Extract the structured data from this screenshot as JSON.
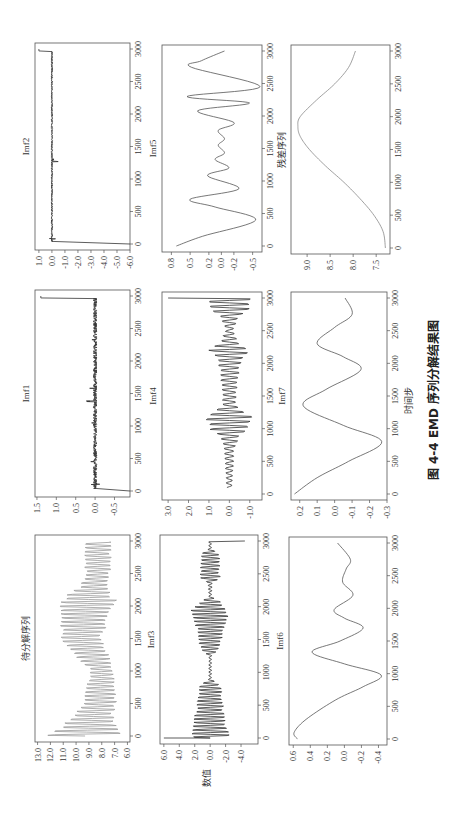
{
  "caption": "图 4-4    EMD 序列分解结果图",
  "xlabel": "时间步",
  "ylabel": "数值",
  "chart_data": [
    {
      "type": "line",
      "title": "待分解序列",
      "box": [
        35,
        535,
        130,
        742
      ],
      "xlim": [
        0,
        3000
      ],
      "xticks": [
        0,
        500,
        1000,
        1500,
        2000,
        2500,
        3000
      ],
      "ylim": [
        5.8,
        13.2
      ],
      "yticks": [
        "13.0",
        "12.0",
        "11.0",
        "10.0",
        "9.0",
        "8.0",
        "7.0",
        "6.0"
      ],
      "ytickvals": [
        13,
        12,
        11,
        10,
        9,
        8,
        7,
        6
      ],
      "color": "#9a9a9a",
      "gen": {
        "kind": "osc",
        "base": [
          [
            0,
            9.3
          ],
          [
            500,
            8.2
          ],
          [
            1000,
            8.0
          ],
          [
            1500,
            9.6
          ],
          [
            2000,
            9.2
          ],
          [
            2500,
            8.3
          ],
          [
            3000,
            8.3
          ]
        ],
        "amp": [
          [
            0,
            3.5
          ],
          [
            300,
            1.8
          ],
          [
            800,
            1.3
          ],
          [
            1000,
            1.0
          ],
          [
            1200,
            1.5
          ],
          [
            1800,
            2.2
          ],
          [
            2100,
            2.6
          ],
          [
            2300,
            1.2
          ],
          [
            3000,
            1.2
          ]
        ],
        "period": 60
      }
    },
    {
      "type": "line",
      "title": "Imf1",
      "box": [
        35,
        290,
        130,
        497
      ],
      "xlim": [
        0,
        3000
      ],
      "xticks": [
        0,
        500,
        1000,
        1500,
        2000,
        2500,
        3000
      ],
      "ylim": [
        -0.9,
        1.55
      ],
      "yticks": [
        "1.5",
        "1.0",
        "0.5",
        "0.0",
        "-0.5"
      ],
      "ytickvals": [
        1.5,
        1.0,
        0.5,
        0.0,
        -0.5
      ],
      "color": "#333333",
      "gen": {
        "kind": "noise",
        "edgeStart": -0.9,
        "edgeEnd": 1.4,
        "amp": 0.05,
        "spikes": [
          [
            100,
            0.12
          ],
          [
            450,
            0.12
          ],
          [
            1050,
            0.2
          ],
          [
            1230,
            0.12
          ],
          [
            1380,
            0.25
          ],
          [
            1580,
            0.22
          ],
          [
            2330,
            0.1
          ]
        ]
      }
    },
    {
      "type": "line",
      "title": "Imf2",
      "box": [
        35,
        43,
        130,
        250
      ],
      "xlim": [
        0,
        3000
      ],
      "xticks": [
        0,
        500,
        1000,
        1500,
        2000,
        2500,
        3000
      ],
      "ylim": [
        -6.0,
        1.3
      ],
      "yticks": [
        "1.0",
        "0.0",
        "-1.0",
        "-2.0",
        "-3.0",
        "-4.0",
        "-5.0",
        "-6.0"
      ],
      "ytickvals": [
        1,
        0,
        -1,
        -2,
        -3,
        -4,
        -5,
        -6
      ],
      "color": "#333333",
      "gen": {
        "kind": "noise",
        "edgeStart": -6.0,
        "edgeEnd": 1.0,
        "amp": 0.06,
        "spikes": [
          [
            80,
            0.3
          ],
          [
            1270,
            0.5
          ],
          [
            1300,
            0.4
          ]
        ]
      }
    },
    {
      "type": "line",
      "title": "Imf3",
      "box": [
        160,
        535,
        258,
        744
      ],
      "xlim": [
        0,
        3000
      ],
      "xticks": [
        0,
        500,
        1000,
        1500,
        2000,
        2500,
        3000
      ],
      "ylim": [
        -6.2,
        6.5
      ],
      "yticks": [
        "6.0",
        "4.0",
        "2.0",
        "0.0",
        "-2.0",
        "-4.0"
      ],
      "ytickvals": [
        6,
        4,
        2,
        0,
        -2,
        -4
      ],
      "color": "#333333",
      "gen": {
        "kind": "osc",
        "base": [
          [
            0,
            0
          ],
          [
            3000,
            0
          ]
        ],
        "amp": [
          [
            0,
            3.0
          ],
          [
            200,
            2.6
          ],
          [
            800,
            1.6
          ],
          [
            900,
            0.2
          ],
          [
            1250,
            0.2
          ],
          [
            1350,
            1.5
          ],
          [
            1700,
            2.2
          ],
          [
            1950,
            3.0
          ],
          [
            2100,
            1.2
          ],
          [
            2150,
            0.2
          ],
          [
            2350,
            0.3
          ],
          [
            2450,
            1.6
          ],
          [
            2800,
            1.4
          ],
          [
            2880,
            0.2
          ],
          [
            3000,
            0.2
          ]
        ],
        "period": 55,
        "edgeStart": 6.0,
        "edgeEnd": -4.5
      }
    },
    {
      "type": "line",
      "title": "Imf4",
      "box": [
        162,
        292,
        262,
        500
      ],
      "xlim": [
        0,
        3000
      ],
      "xticks": [
        0,
        500,
        1000,
        1500,
        2000,
        2500,
        3000
      ],
      "ylim": [
        -1.6,
        3.3
      ],
      "yticks": [
        "3.0",
        "2.0",
        "1.0",
        "0.0",
        "-1.0"
      ],
      "ytickvals": [
        3,
        2,
        1,
        0,
        -1
      ],
      "color": "#333333",
      "gen": {
        "kind": "osc",
        "base": [
          [
            0,
            0
          ],
          [
            3000,
            0
          ]
        ],
        "amp": [
          [
            100,
            0.15
          ],
          [
            700,
            0.3
          ],
          [
            900,
            0.6
          ],
          [
            1000,
            1.2
          ],
          [
            1150,
            1.5
          ],
          [
            1250,
            1.0
          ],
          [
            1350,
            0.4
          ],
          [
            1800,
            0.5
          ],
          [
            2100,
            0.8
          ],
          [
            2200,
            1.2
          ],
          [
            2300,
            0.6
          ],
          [
            2500,
            0.2
          ],
          [
            2700,
            0.5
          ],
          [
            2850,
            1.2
          ],
          [
            3000,
            1.2
          ]
        ],
        "period": 75,
        "start": 100,
        "edgeEnd": 3.0
      }
    },
    {
      "type": "line",
      "title": "Imf5",
      "box": [
        162,
        45,
        262,
        252
      ],
      "xlim": [
        0,
        3000
      ],
      "xticks": [
        0,
        500,
        1000,
        1500,
        2000,
        2500,
        3000
      ],
      "ylim": [
        -0.65,
        0.95
      ],
      "yticks": [
        "0.8",
        "0.5",
        "0.2",
        "0.0",
        "-0.2",
        "-0.5"
      ],
      "ytickvals": [
        0.8,
        0.5,
        0.2,
        0.0,
        -0.2,
        -0.5
      ],
      "color": "#555555",
      "points": [
        [
          0,
          0.72
        ],
        [
          150,
          0.3
        ],
        [
          400,
          -0.55
        ],
        [
          600,
          0.1
        ],
        [
          720,
          0.5
        ],
        [
          880,
          -0.28
        ],
        [
          1080,
          0.22
        ],
        [
          1200,
          -0.12
        ],
        [
          1330,
          0.1
        ],
        [
          1430,
          -0.05
        ],
        [
          1550,
          0.05
        ],
        [
          1650,
          -0.05
        ],
        [
          1780,
          0.05
        ],
        [
          1900,
          -0.2
        ],
        [
          2080,
          0.38
        ],
        [
          2200,
          -0.45
        ],
        [
          2300,
          0.55
        ],
        [
          2450,
          -0.62
        ],
        [
          2750,
          0.48
        ],
        [
          2850,
          0.32
        ],
        [
          3000,
          -0.05
        ]
      ]
    },
    {
      "type": "line",
      "title": "Imf6",
      "box": [
        289,
        537,
        387,
        745
      ],
      "xlim": [
        0,
        3000
      ],
      "xticks": [
        0,
        500,
        1000,
        1500,
        2000,
        2500,
        3000
      ],
      "ylim": [
        -0.5,
        0.65
      ],
      "yticks": [
        "0.6",
        "0.4",
        "0.2",
        "0.0",
        "-0.2",
        "-0.4"
      ],
      "ytickvals": [
        0.6,
        0.4,
        0.2,
        0.0,
        -0.2,
        -0.4
      ],
      "color": "#555555",
      "points": [
        [
          0,
          0.55
        ],
        [
          100,
          0.59
        ],
        [
          300,
          0.45
        ],
        [
          600,
          0.1
        ],
        [
          800,
          -0.22
        ],
        [
          980,
          -0.43
        ],
        [
          1150,
          0.0
        ],
        [
          1330,
          0.38
        ],
        [
          1500,
          0.05
        ],
        [
          1700,
          -0.22
        ],
        [
          1850,
          0.0
        ],
        [
          1980,
          0.12
        ],
        [
          2200,
          -0.1
        ],
        [
          2400,
          0.02
        ],
        [
          2600,
          -0.02
        ],
        [
          2750,
          -0.07
        ],
        [
          3000,
          0.08
        ]
      ]
    },
    {
      "type": "line",
      "title": "Imf7",
      "box": [
        291,
        292,
        387,
        500
      ],
      "xlim": [
        0,
        3000
      ],
      "xticks": [
        0,
        500,
        1000,
        1500,
        2000,
        2500,
        3000
      ],
      "ylim": [
        -0.3,
        0.25
      ],
      "yticks": [
        "0.2",
        "0.1",
        "0.0",
        "-0.1",
        "-0.2",
        "-0.3"
      ],
      "ytickvals": [
        0.2,
        0.1,
        0.0,
        -0.1,
        -0.2,
        -0.3
      ],
      "color": "#555555",
      "points": [
        [
          0,
          0.23
        ],
        [
          250,
          0.1
        ],
        [
          500,
          -0.08
        ],
        [
          800,
          -0.27
        ],
        [
          1050,
          -0.05
        ],
        [
          1350,
          0.18
        ],
        [
          1600,
          0.05
        ],
        [
          1900,
          -0.15
        ],
        [
          2100,
          -0.05
        ],
        [
          2300,
          0.1
        ],
        [
          2550,
          0.0
        ],
        [
          2750,
          -0.1
        ],
        [
          3000,
          -0.06
        ]
      ]
    },
    {
      "type": "line",
      "title": "残差序列",
      "box": [
        291,
        45,
        390,
        254
      ],
      "xlim": [
        0,
        3000
      ],
      "xticks": [
        0,
        500,
        1000,
        1500,
        2000,
        2500,
        3000
      ],
      "ylim": [
        7.2,
        9.35
      ],
      "yticks": [
        "9.0",
        "8.5",
        "8.0",
        "7.5"
      ],
      "ytickvals": [
        9.0,
        8.5,
        8.0,
        7.5
      ],
      "color": "#888888",
      "points": [
        [
          0,
          7.3
        ],
        [
          250,
          7.35
        ],
        [
          500,
          7.55
        ],
        [
          750,
          7.85
        ],
        [
          1000,
          8.2
        ],
        [
          1250,
          8.6
        ],
        [
          1500,
          8.95
        ],
        [
          1700,
          9.15
        ],
        [
          1850,
          9.2
        ],
        [
          2000,
          9.15
        ],
        [
          2250,
          8.8
        ],
        [
          2500,
          8.4
        ],
        [
          2750,
          8.1
        ],
        [
          3000,
          7.95
        ]
      ]
    }
  ]
}
